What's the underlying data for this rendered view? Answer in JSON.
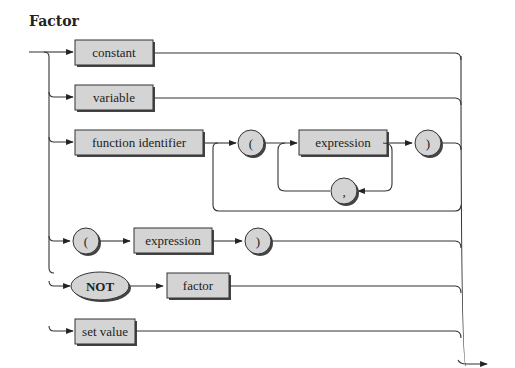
{
  "diagram": {
    "title": "Factor",
    "type": "railroad syntax diagram",
    "nodes": {
      "constant": "constant",
      "variable": "variable",
      "function_identifier": "function identifier",
      "lparen_func": "(",
      "expression_func": "expression",
      "comma": ",",
      "rparen_func": ")",
      "lparen": "(",
      "expression": "expression",
      "rparen": ")",
      "not": "NOT",
      "factor": "factor",
      "set_value": "set value"
    },
    "branches": [
      [
        "constant"
      ],
      [
        "variable"
      ],
      [
        "function identifier",
        "(",
        "expression {, expression}",
        ")"
      ],
      [
        "(",
        "expression",
        ")"
      ],
      [
        "NOT",
        "factor"
      ],
      [
        "set value"
      ]
    ],
    "colors": {
      "box_fill": "#d4d4d4",
      "stroke": "#333333",
      "background": "#ffffff"
    }
  }
}
